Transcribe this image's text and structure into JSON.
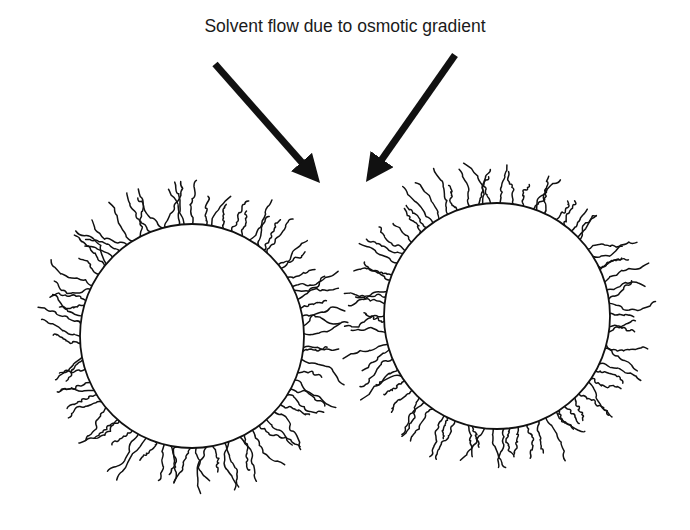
{
  "figure": {
    "caption": "Solvent flow due to osmotic gradient",
    "background": "#ffffff",
    "ink_color": "#111111"
  },
  "arrows": [
    {
      "name": "left-arrow",
      "from": [
        215,
        64
      ],
      "to": [
        320,
        183
      ],
      "stroke_width": 7
    },
    {
      "name": "right-arrow",
      "from": [
        455,
        55
      ],
      "to": [
        366,
        182
      ],
      "stroke_width": 7
    }
  ],
  "particles": [
    {
      "name": "left-particle",
      "center": [
        192,
        336
      ],
      "radius": 112,
      "chain_count": 78,
      "chain_length_min": 22,
      "chain_length_max": 52,
      "seed": 17
    },
    {
      "name": "right-particle",
      "center": [
        497,
        316
      ],
      "radius": 113,
      "chain_count": 78,
      "chain_length_min": 22,
      "chain_length_max": 50,
      "seed": 53
    }
  ],
  "overlap_region": {
    "description": "Interpenetrating stabilizer chains between the two particles",
    "x_range": [
      300,
      390
    ],
    "y_range": [
      240,
      400
    ]
  }
}
